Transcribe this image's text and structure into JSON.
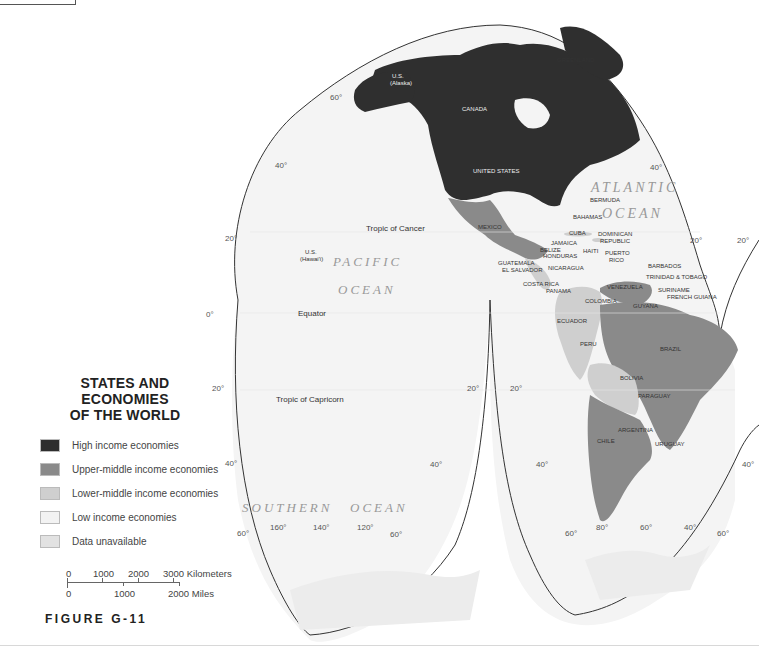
{
  "legend": {
    "title_line1": "STATES AND ECONOMIES",
    "title_line2": "OF THE WORLD",
    "items": [
      {
        "label": "High income economies",
        "color": "#2e2e2e"
      },
      {
        "label": "Upper-middle income economies",
        "color": "#8a8a8a"
      },
      {
        "label": "Lower-middle income economies",
        "color": "#cfcfcf"
      },
      {
        "label": "Low income economies",
        "color": "#f3f3f3"
      },
      {
        "label": "Data unavailable",
        "color": "#e2e2e2"
      }
    ]
  },
  "scale": {
    "km_labels": [
      "0",
      "1000",
      "2000",
      "3000 Kilometers"
    ],
    "mi_labels": [
      "0",
      "1000",
      "2000 Miles"
    ]
  },
  "figure_label": "FIGURE G-11",
  "oceans": {
    "pacific_1": "PACIFIC",
    "pacific_2": "OCEAN",
    "atlantic_1": "ATLANTIC",
    "atlantic_2": "OCEAN",
    "southern_1": "SOUTHERN",
    "southern_2": "OCEAN"
  },
  "lines": {
    "tropic_cancer": "Tropic of Cancer",
    "equator": "Equator",
    "tropic_capricorn": "Tropic of Capricorn"
  },
  "countries": {
    "greenland": "GREENLAND",
    "us_alaska_1": "U.S.",
    "us_alaska_2": "(Alaska)",
    "canada": "CANADA",
    "united_states": "UNITED STATES",
    "us_hawaii_1": "U.S.",
    "us_hawaii_2": "(Hawai'i)",
    "mexico": "MEXICO",
    "bermuda": "BERMUDA",
    "bahamas": "BAHAMAS",
    "cuba": "CUBA",
    "dominican_1": "DOMINICAN",
    "dominican_2": "REPUBLIC",
    "jamaica": "JAMAICA",
    "belize": "BELIZE",
    "honduras": "HONDURAS",
    "haiti": "HAITI",
    "puerto_1": "PUERTO",
    "puerto_2": "RICO",
    "guatemala": "GUATEMALA",
    "el_salvador": "EL SALVADOR",
    "nicaragua": "NICARAGUA",
    "barbados": "BARBADOS",
    "trinidad": "TRINIDAD & TOBAGO",
    "costa_rica": "COSTA RICA",
    "panama": "PANAMA",
    "venezuela": "VENEZUELA",
    "suriname": "SURINAME",
    "french_guiana": "FRENCH GUIANA",
    "guyana": "GUYANA",
    "colombia": "COLOMBIA",
    "ecuador": "ECUADOR",
    "peru": "PERU",
    "brazil": "BRAZIL",
    "bolivia": "BOLIVIA",
    "paraguay": "PARAGUAY",
    "argentina": "ARGENTINA",
    "chile": "CHILE",
    "uruguay": "URUGUAY"
  },
  "graticule": {
    "lat60_n": "60°",
    "lat40_nw": "40°",
    "lat40_ne": "40°",
    "lat20_nw": "20°",
    "lat20_ne": "20°",
    "lat20_far": "20°",
    "lat0": "0°",
    "lat20_sw": "20°",
    "lat20_sm": "20°",
    "lat20_se": "20°",
    "lat40_sw": "40°",
    "lat40_sm": "40°",
    "lat40_se": "40°",
    "lat40_far": "40°",
    "lat60_sw": "60°",
    "lat60_sm": "60°",
    "lat60_se": "60°",
    "lat60_far": "60°",
    "lon160": "160°",
    "lon140": "140°",
    "lon120": "120°",
    "lon80": "80°",
    "lon60": "60°",
    "lon40": "40°"
  }
}
